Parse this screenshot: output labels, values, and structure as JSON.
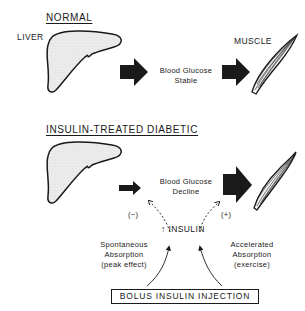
{
  "normal": {
    "heading": "NORMAL",
    "liver_label": "LIVER",
    "muscle_label": "MUSCLE",
    "center_text_line1": "Blood Glucose",
    "center_text_line2": "Stable"
  },
  "diabetic": {
    "heading": "INSULIN-TREATED DIABETIC",
    "center_text_line1": "Blood Glucose",
    "center_text_line2": "Decline",
    "insulin_label": "INSULIN",
    "insulin_arrow": "↑",
    "minus_sign": "(−)",
    "plus_sign": "(+)",
    "left_note": [
      "Spontaneous",
      "Absorption",
      "(peak effect)"
    ],
    "right_note": [
      "Accelerated",
      "Absorption",
      "(exercise)"
    ],
    "bolus_box": "BOLUS INSULIN INJECTION"
  },
  "colors": {
    "ink": "#1a1a1a",
    "liver_fill": "#e6e6e6",
    "background": "#ffffff"
  }
}
